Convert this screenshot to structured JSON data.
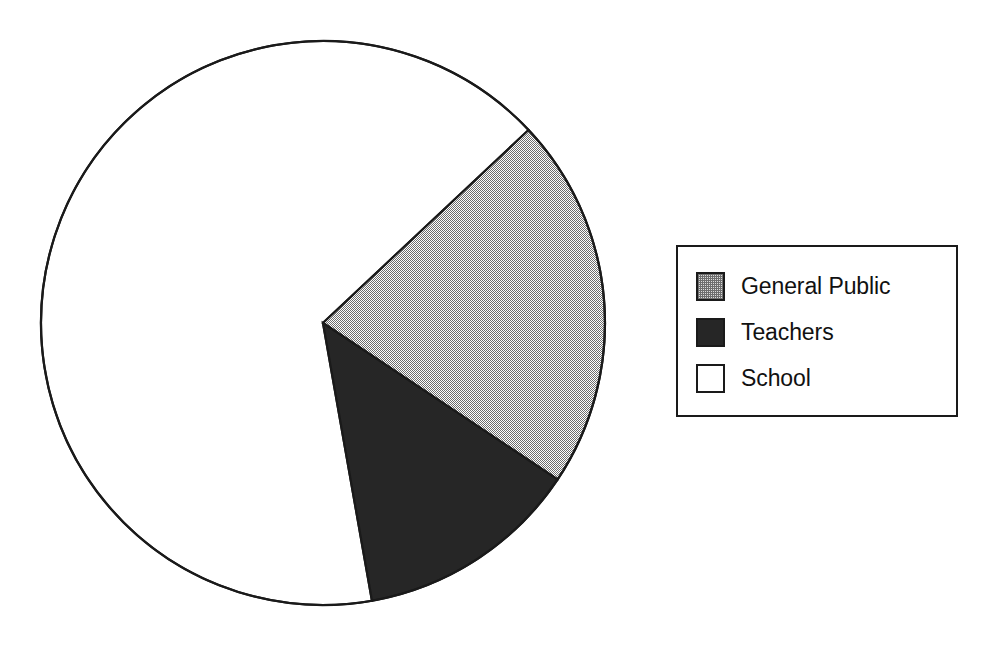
{
  "chart_data": {
    "type": "pie",
    "title": "",
    "subtitle": "",
    "xlabel": "",
    "ylabel": "",
    "grid": false,
    "legend_position": "right",
    "start_angle_deg_clockwise_from_top": 46.8,
    "center": {
      "x": 323,
      "y": 323
    },
    "radius": 282,
    "categories": [
      "General Public",
      "Teachers",
      "School"
    ],
    "values": [
      21.3,
      12.9,
      65.8
    ],
    "angles_deg": [
      76.9,
      46.3,
      236.8
    ],
    "slices": [
      {
        "label": "General Public",
        "value": 21.3,
        "angle_deg": 76.9,
        "start_deg": 46.8,
        "end_deg": 123.7,
        "fill": "#b4b4b4",
        "pattern": "checkerboard-dither-50",
        "stroke": "#1a1a1a"
      },
      {
        "label": "Teachers",
        "value": 12.9,
        "angle_deg": 46.3,
        "start_deg": 123.7,
        "end_deg": 170.0,
        "fill": "#262626",
        "pattern": "solid",
        "stroke": "#1a1a1a"
      },
      {
        "label": "School",
        "value": 65.8,
        "angle_deg": 236.8,
        "start_deg": 170.0,
        "end_deg": 406.8,
        "fill": "#ffffff",
        "pattern": "solid",
        "stroke": "#1a1a1a"
      }
    ],
    "annotations": []
  },
  "legend": {
    "items": [
      {
        "label": "General Public",
        "swatch": "general-public-swatch",
        "fill": "#b4b4b4",
        "pattern": "checkerboard-dither-50"
      },
      {
        "label": "Teachers",
        "swatch": "teachers-swatch",
        "fill": "#262626",
        "pattern": "solid"
      },
      {
        "label": "School",
        "swatch": "school-swatch",
        "fill": "#ffffff",
        "pattern": "solid"
      }
    ]
  },
  "colors": {
    "outline": "#1a1a1a",
    "background": "#ffffff",
    "general_public": "#b4b4b4",
    "teachers": "#262626",
    "school": "#ffffff"
  }
}
